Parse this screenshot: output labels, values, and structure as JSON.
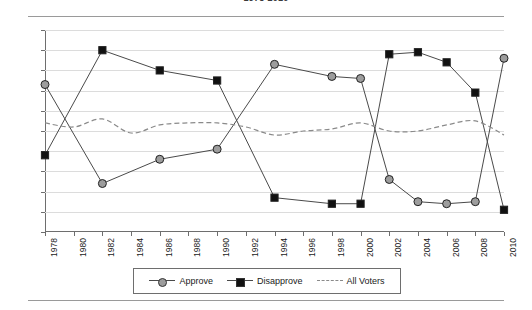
{
  "chart_title": "1978-2010",
  "legend": {
    "items": [
      {
        "label": "Approve",
        "marker": "circle-marker-icon",
        "style": "solid"
      },
      {
        "label": "Disapprove",
        "marker": "square-marker-icon",
        "style": "solid"
      },
      {
        "label": "All Voters",
        "marker": "dashed-line-icon",
        "style": "dashed"
      }
    ]
  },
  "chart_data": {
    "type": "line",
    "title": "1978-2010",
    "xlabel": "",
    "ylabel": "",
    "ylim": [
      0,
      100
    ],
    "xlim": [
      1978,
      2010
    ],
    "grid": true,
    "legend_position": "bottom",
    "y_ticks": [
      "0%",
      "10%",
      "20%",
      "30%",
      "40%",
      "50%",
      "60%",
      "70%",
      "80%",
      "90%",
      "100%"
    ],
    "y_tick_values": [
      0,
      10,
      20,
      30,
      40,
      50,
      60,
      70,
      80,
      90,
      100
    ],
    "x_ticks": [
      "1978",
      "1980",
      "1982",
      "1984",
      "1986",
      "1988",
      "1990",
      "1992",
      "1994",
      "1996",
      "1998",
      "2000",
      "2002",
      "2004",
      "2006",
      "2008",
      "2010"
    ],
    "x_tick_values": [
      1978,
      1980,
      1982,
      1984,
      1986,
      1988,
      1990,
      1992,
      1994,
      1996,
      1998,
      2000,
      2002,
      2004,
      2006,
      2008,
      2010
    ],
    "series": [
      {
        "name": "Approve",
        "marker": "circle",
        "style": "solid",
        "color": "#9d9d9d",
        "x": [
          1978,
          1982,
          1986,
          1990,
          1994,
          1998,
          2000,
          2002,
          2004,
          2006,
          2008,
          2010
        ],
        "values": [
          73,
          24,
          36,
          41,
          83,
          77,
          76,
          26,
          15,
          14,
          15,
          86
        ]
      },
      {
        "name": "Disapprove",
        "marker": "square",
        "style": "solid",
        "color": "#111111",
        "x": [
          1978,
          1982,
          1986,
          1990,
          1994,
          1998,
          2000,
          2002,
          2004,
          2006,
          2008,
          2010
        ],
        "values": [
          38,
          90,
          80,
          75,
          17,
          14,
          14,
          88,
          89,
          84,
          69,
          11
        ]
      },
      {
        "name": "All Voters",
        "marker": "none",
        "style": "dashed",
        "color": "#8a8a8a",
        "x": [
          1978,
          1980,
          1982,
          1984,
          1986,
          1988,
          1990,
          1992,
          1994,
          1996,
          1998,
          2000,
          2002,
          2004,
          2006,
          2008,
          2010
        ],
        "values": [
          54,
          52,
          56,
          49,
          53,
          54,
          54,
          52,
          48,
          50,
          51,
          54,
          50,
          50,
          53,
          55,
          48
        ]
      }
    ]
  }
}
